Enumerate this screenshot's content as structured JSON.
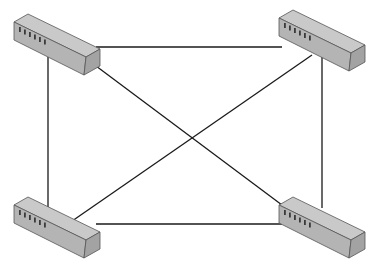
{
  "diagram": {
    "type": "network-topology",
    "topology": "full-mesh",
    "colors": {
      "background": "#ffffff",
      "link": "#1a1a1a",
      "switch_top": "#c9c9c9",
      "switch_front": "#b4b4b4",
      "switch_end": "#a3a3a3",
      "port": "#3a3a3a"
    },
    "nodes": [
      {
        "id": "switch-top-left",
        "icon": "network-switch-icon",
        "x": 0,
        "y": 0,
        "ports": 6
      },
      {
        "id": "switch-top-right",
        "icon": "network-switch-icon",
        "x": 265,
        "y": -4,
        "ports": 6
      },
      {
        "id": "switch-bottom-left",
        "icon": "network-switch-icon",
        "x": 0,
        "y": 183,
        "ports": 6
      },
      {
        "id": "switch-bottom-right",
        "icon": "network-switch-icon",
        "x": 265,
        "y": 183,
        "ports": 6
      }
    ],
    "links": [
      {
        "from": "switch-top-left",
        "to": "switch-top-right",
        "x1": 96,
        "y1": 47,
        "x2": 282,
        "y2": 47
      },
      {
        "from": "switch-top-left",
        "to": "switch-bottom-left",
        "x1": 48,
        "y1": 57,
        "x2": 48,
        "y2": 207
      },
      {
        "from": "switch-top-right",
        "to": "switch-bottom-right",
        "x1": 322,
        "y1": 52,
        "x2": 322,
        "y2": 208
      },
      {
        "from": "switch-bottom-left",
        "to": "switch-bottom-right",
        "x1": 96,
        "y1": 224,
        "x2": 282,
        "y2": 224
      },
      {
        "from": "switch-top-left",
        "to": "switch-bottom-right",
        "x1": 88,
        "y1": 60,
        "x2": 286,
        "y2": 208
      },
      {
        "from": "switch-top-right",
        "to": "switch-bottom-left",
        "x1": 312,
        "y1": 55,
        "x2": 62,
        "y2": 228
      }
    ]
  }
}
